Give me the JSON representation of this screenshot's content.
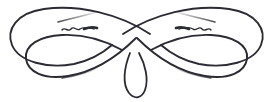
{
  "image": {
    "kind": "decorative-flourish-ornament",
    "title": "Calligraphic swirl divider",
    "width": 273,
    "height": 102,
    "background_color": "#ffffff",
    "ink_color": "#2b2b33",
    "ink_color_light": "#5a5a63",
    "symmetry": "bilateral-horizontal",
    "alt_text": "Ornamental calligraphic flourish divider with two large interlocking loops, a central crossing and a small teardrop pendant"
  },
  "parts": {
    "outer_loop_left": {
      "name": "large left loop",
      "path": "M 150 34 C 120 14 78 4 44 9 C 16 13 6 30 12 45 C 19 62 48 69 74 64 C 92 60 104 52 112 45",
      "stroke_width": 1.9,
      "color": "#2b2b33"
    },
    "outer_loop_right": {
      "name": "large right loop",
      "path": "M 123 34 C 153 14 195 4 229 9 C 257 13 267 30 261 45 C 254 62 225 69 199 64 C 181 60 169 52 161 45",
      "stroke_width": 1.9,
      "color": "#2b2b33"
    },
    "inner_loop_left": {
      "name": "lower left loop",
      "path": "M 136 38 C 118 56 94 72 68 76 C 44 80 28 72 26 59 C 24 45 40 36 62 35 C 84 34 104 40 122 50",
      "stroke_width": 1.9,
      "color": "#2b2b33"
    },
    "inner_loop_right": {
      "name": "lower right loop",
      "path": "M 137 38 C 155 56 179 72 205 76 C 229 80 245 72 247 59 C 249 45 233 36 211 35 C 189 34 169 40 151 50",
      "stroke_width": 1.9,
      "color": "#2b2b33"
    },
    "pendant_teardrop": {
      "name": "central teardrop pendant",
      "path": "M 130 53 C 124 68 122 84 129 93 C 135 100 142 98 145 90 C 149 79 145 64 139 53",
      "stroke_width": 1.8,
      "color": "#2b2b33"
    },
    "tail_upper_left": {
      "name": "upper left tapering tail",
      "path": "M 58 22 C 74 18 90 14 101 11",
      "stroke_width": 1.2,
      "color": "#6d6d76"
    },
    "tail_upper_right": {
      "name": "upper right tapering tail",
      "path": "M 215 22 C 199 18 183 14 172 11",
      "stroke_width": 1.2,
      "color": "#6d6d76"
    },
    "tail_lower_left": {
      "name": "lower left tapering tail",
      "path": "M 62 78 C 76 76 90 72 100 67",
      "stroke_width": 1.2,
      "color": "#6d6d76"
    },
    "tail_lower_right": {
      "name": "lower right tapering tail",
      "path": "M 211 78 C 197 76 183 72 173 67",
      "stroke_width": 1.2,
      "color": "#6d6d76"
    },
    "squiggle_left": {
      "name": "left tilde squiggle",
      "path": "M 62 30 C 65 26 68 33 71 29 C 74 25 77 32 80 29 C 84 26 89 28 94 29",
      "stroke_width": 1.4,
      "color": "#2b2b33"
    },
    "squiggle_left_tip": {
      "name": "left squiggle tip stroke",
      "path": "M 84 29 C 89 27 94 27 97 28",
      "stroke_width": 2.6,
      "color": "#2b2b33"
    },
    "squiggle_right": {
      "name": "right tilde squiggle",
      "path": "M 211 30 C 208 26 205 33 202 29 C 199 25 196 32 193 29 C 189 26 184 28 179 29",
      "stroke_width": 1.4,
      "color": "#2b2b33"
    },
    "squiggle_right_tip": {
      "name": "right squiggle tip stroke",
      "path": "M 189 29 C 184 27 179 27 176 28",
      "stroke_width": 2.6,
      "color": "#2b2b33"
    }
  }
}
